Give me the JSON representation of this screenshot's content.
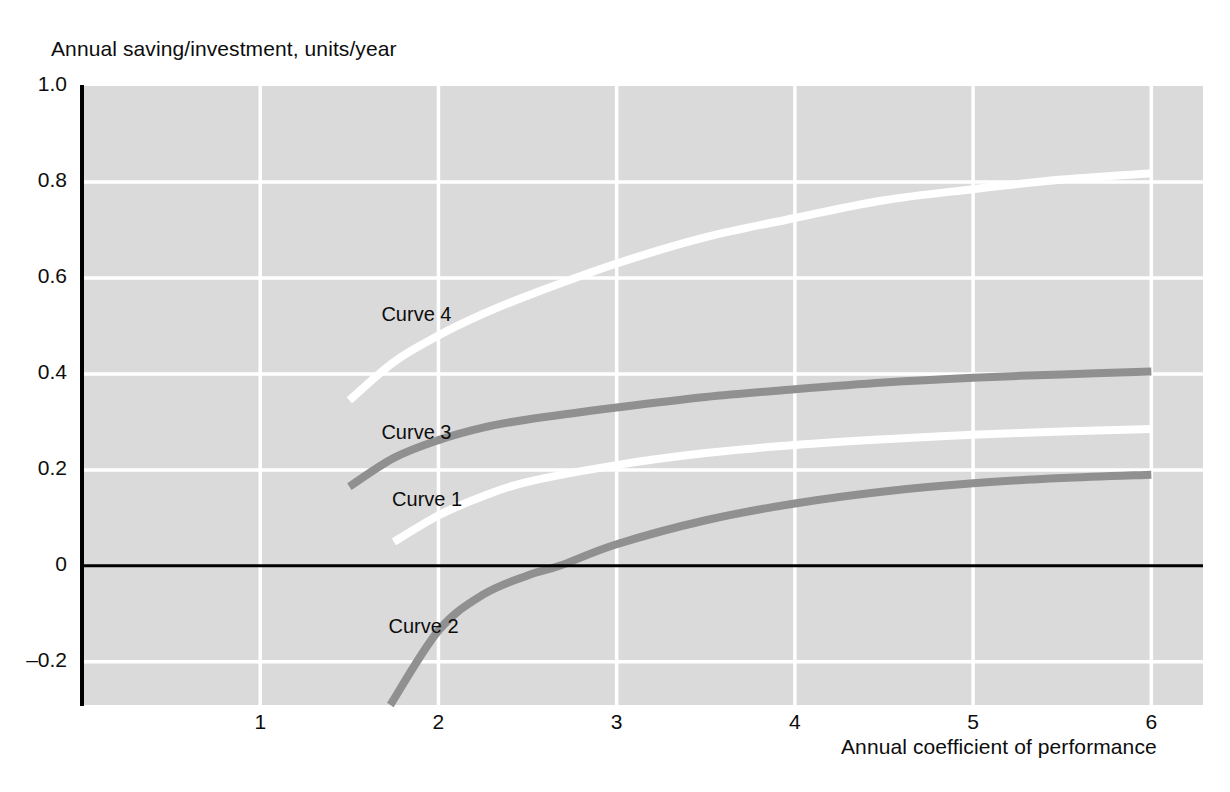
{
  "chart_data": {
    "type": "line",
    "title": "",
    "ylabel": "Annual saving/investment, units/year",
    "xlabel": "Annual coefficient of performance",
    "xlim": [
      0,
      6.29
    ],
    "ylim": [
      -0.29,
      1.0
    ],
    "grid": true,
    "legend_position": "inline-labels",
    "background": "#dadada",
    "gridline_color": "#ffffff",
    "zero_line_color": "#000000",
    "xticks": [
      "1",
      "2",
      "3",
      "4",
      "5",
      "6"
    ],
    "xtick_values": [
      1,
      2,
      3,
      4,
      5,
      6
    ],
    "yticks": [
      "1.0",
      "0.8",
      "0.6",
      "0.4",
      "0.2",
      "0",
      "–0.2"
    ],
    "ytick_values": [
      1.0,
      0.8,
      0.6,
      0.4,
      0.2,
      0,
      -0.2
    ],
    "series": [
      {
        "name": "Curve 1",
        "color": "#ffffff",
        "label": "Curve 1",
        "label_x": 1.74,
        "label_y": 0.135,
        "x": [
          1.75,
          2.0,
          2.25,
          2.5,
          3.0,
          3.5,
          4.0,
          4.5,
          5.0,
          5.5,
          6.0
        ],
        "y": [
          0.05,
          0.105,
          0.145,
          0.175,
          0.21,
          0.235,
          0.252,
          0.264,
          0.273,
          0.28,
          0.285
        ]
      },
      {
        "name": "Curve 2",
        "color": "#909090",
        "label": "Curve 2",
        "label_x": 1.72,
        "label_y": -0.13,
        "x": [
          1.73,
          2.0,
          2.25,
          2.5,
          2.68,
          3.0,
          3.5,
          4.0,
          4.5,
          5.0,
          5.5,
          6.0
        ],
        "y": [
          -0.29,
          -0.135,
          -0.06,
          -0.02,
          0.0,
          0.045,
          0.095,
          0.13,
          0.155,
          0.172,
          0.183,
          0.19
        ]
      },
      {
        "name": "Curve 3",
        "color": "#909090",
        "label": "Curve 3",
        "label_x": 1.68,
        "label_y": 0.275,
        "x": [
          1.5,
          1.75,
          2.0,
          2.25,
          2.5,
          3.0,
          3.5,
          4.0,
          4.5,
          5.0,
          5.5,
          6.0
        ],
        "y": [
          0.165,
          0.225,
          0.262,
          0.288,
          0.305,
          0.33,
          0.352,
          0.368,
          0.382,
          0.392,
          0.399,
          0.405
        ]
      },
      {
        "name": "Curve 4",
        "color": "#ffffff",
        "label": "Curve 4",
        "label_x": 1.68,
        "label_y": 0.52,
        "x": [
          1.5,
          1.75,
          2.0,
          2.25,
          2.5,
          3.0,
          3.5,
          4.0,
          4.5,
          5.0,
          5.5,
          6.0
        ],
        "y": [
          0.345,
          0.425,
          0.48,
          0.525,
          0.563,
          0.63,
          0.685,
          0.725,
          0.762,
          0.785,
          0.805,
          0.818
        ]
      }
    ]
  }
}
